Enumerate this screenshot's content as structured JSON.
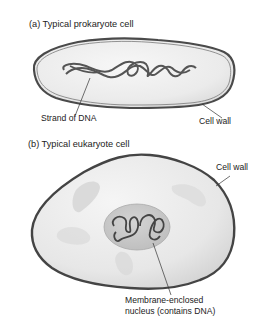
{
  "panel_a": {
    "title": "(a) Typical prokaryote cell",
    "labels": {
      "dna": "Strand of DNA",
      "cell_wall": "Cell wall"
    }
  },
  "panel_b": {
    "title": "(b) Typical eukaryote cell",
    "labels": {
      "cell_wall": "Cell wall",
      "nucleus_line1": "Membrane-enclosed",
      "nucleus_line2": "nucleus (contains DNA)"
    }
  },
  "colors": {
    "wall_outline": "#4a4a4a",
    "cytoplasm": "#ececec",
    "nucleus": "#c9c9c9",
    "dna": "#555555",
    "organelle": "#d8d8d8"
  }
}
